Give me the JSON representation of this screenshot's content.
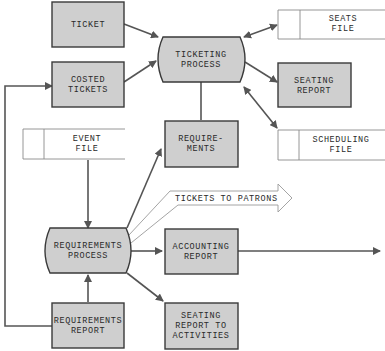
{
  "diagram": {
    "type": "data-flow",
    "colors": {
      "box_fill": "#cfcfcf",
      "box_stroke": "#3a3a3a",
      "arrow": "#555555",
      "file_stroke": "#8a8a8a"
    },
    "nodes": {
      "ticket": {
        "line1": "TICKET"
      },
      "costed_tickets": {
        "line1": "COSTED",
        "line2": "TICKETS"
      },
      "ticketing_process": {
        "line1": "TICKETING",
        "line2": "PROCESS"
      },
      "seats_file": {
        "line1": "SEATS",
        "line2": "FILE"
      },
      "seating_report": {
        "line1": "SEATING",
        "line2": "REPORT"
      },
      "scheduling_file": {
        "line1": "SCHEDULING",
        "line2": "FILE"
      },
      "requirements": {
        "line1": "REQUIRE-",
        "line2": "MENTS"
      },
      "event_file": {
        "line1": "EVENT",
        "line2": "FILE"
      },
      "tickets_to_patrons": {
        "line1": "TICKETS TO PATRONS"
      },
      "requirements_process": {
        "line1": "REQUIREMENTS",
        "line2": "PROCESS"
      },
      "accounting_report": {
        "line1": "ACCOUNTING",
        "line2": "REPORT"
      },
      "requirements_report": {
        "line1": "REQUIREMENTS",
        "line2": "REPORT"
      },
      "seating_report_to_activities": {
        "line1": "SEATING",
        "line2": "REPORT TO",
        "line3": "ACTIVITIES"
      }
    },
    "edges": [
      {
        "from": "TICKET",
        "to": "TICKETING PROCESS"
      },
      {
        "from": "COSTED TICKETS",
        "to": "TICKETING PROCESS"
      },
      {
        "from": "TICKETING PROCESS",
        "to": "SEATS FILE",
        "bidirectional": true
      },
      {
        "from": "TICKETING PROCESS",
        "to": "SEATING REPORT"
      },
      {
        "from": "TICKETING PROCESS",
        "to": "SCHEDULING FILE",
        "bidirectional": true
      },
      {
        "from": "TICKETING PROCESS",
        "to": "REQUIREMENTS"
      },
      {
        "from": "EVENT FILE",
        "to": "REQUIREMENTS PROCESS"
      },
      {
        "from": "REQUIREMENTS PROCESS",
        "to": "REQUIREMENTS"
      },
      {
        "from": "REQUIREMENTS PROCESS",
        "to": "TICKETS TO PATRONS"
      },
      {
        "from": "REQUIREMENTS PROCESS",
        "to": "ACCOUNTING REPORT"
      },
      {
        "from": "ACCOUNTING REPORT",
        "to": "off-page"
      },
      {
        "from": "REQUIREMENTS PROCESS",
        "to": "SEATING REPORT TO ACTIVITIES"
      },
      {
        "from": "REQUIREMENTS REPORT",
        "to": "REQUIREMENTS PROCESS"
      },
      {
        "from": "REQUIREMENTS REPORT",
        "to": "COSTED TICKETS"
      }
    ]
  }
}
